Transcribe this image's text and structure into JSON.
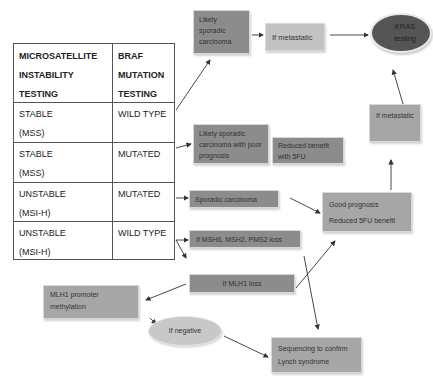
{
  "table": {
    "headers": [
      "MICROSATELLITE\nINSTABILITY\nTESTING",
      "BRAF\nMUTATION\nTESTING"
    ],
    "header_lines": {
      "col1": [
        "MICROSATELLITE",
        "INSTABILITY",
        "TESTING"
      ],
      "col2": [
        "BRAF",
        "MUTATION",
        "TESTING"
      ]
    },
    "rows": [
      {
        "msi": "STABLE",
        "msi_code": "(MSS)",
        "braf": "WILD TYPE"
      },
      {
        "msi": "STABLE",
        "msi_code": "(MSS)",
        "braf": "MUTATED"
      },
      {
        "msi": "UNSTABLE",
        "msi_code": "(MSI-H)",
        "braf": "MUTATED"
      },
      {
        "msi": "UNSTABLE",
        "msi_code": "(MSI-H)",
        "braf": "WILD TYPE"
      }
    ]
  },
  "nodes": {
    "likely_sporadic": "Likely sporadic carcinoma",
    "if_metastatic_top": "If metastatic",
    "kras_testing": "KRAS testing",
    "likely_sporadic_poor": "Likely sporadic carcinoma with poor prognosis",
    "reduced_benefit_5fu": "Reduced benefit with 5FU",
    "if_metastatic_right": "If metastatic",
    "sporadic_carcinoma": "Sporadic carcinoma",
    "good_prognosis": "Good prognosis",
    "reduced_5fu_benefit": "Reduced 5FU benefit",
    "msh_loss": "If MSH6, MSH2, PMS2 loss",
    "mlh1_loss": "If MLH1 loss",
    "mlh1_promoter": "MLH1 promoter methylation",
    "if_negative": "If negative",
    "sequencing": "Sequencing to confirm Lynch syndrome"
  },
  "colors": {
    "dark_box": "#8c8c8c",
    "mid_box": "#a6a6a6",
    "light_box": "#c2c2c2",
    "kras_oval": "#555555",
    "negative_oval": "#c8c8c8",
    "arrow": "#333333"
  }
}
